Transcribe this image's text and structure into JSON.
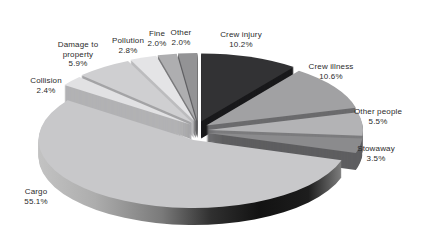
{
  "chart_data": {
    "type": "pie",
    "style": "3d-exploded-pie",
    "title": "",
    "unit": "%",
    "direction": "clockwise",
    "start_angle_deg_from_12": 0,
    "total": 100.0,
    "background": "#ffffff",
    "text_color": "#2b2b2b",
    "geometry": {
      "cx": 198,
      "cy": 131,
      "rx": 155,
      "ry": 68,
      "depth": 17,
      "default_explode": 10
    },
    "slices": [
      {
        "label": "Crew injury",
        "value": 10.2,
        "percent_label": "10.2%",
        "color": "#323234",
        "wall": "#19191b",
        "label_lines": [
          "Crew injury",
          "10.2%"
        ],
        "label_x": 241,
        "label_y": 30
      },
      {
        "label": "Crew illness",
        "value": 10.6,
        "percent_label": "10.6%",
        "color": "#a1a1a3",
        "wall": "#6b6b6d",
        "label_lines": [
          "Crew illness",
          "10.6%"
        ],
        "label_x": 331,
        "label_y": 62
      },
      {
        "label": "Other people",
        "value": 5.5,
        "percent_label": "5.5%",
        "color": "#b3b3b5",
        "wall": "#7c7c7e",
        "label_lines": [
          "Other people",
          "5.5%"
        ],
        "label_x": 378,
        "label_y": 107
      },
      {
        "label": "Stowaway",
        "value": 3.5,
        "percent_label": "3.5%",
        "color": "#8b8b8d",
        "wall": "#5e5e60",
        "label_lines": [
          "Stowaway",
          "3.5%"
        ],
        "label_x": 376,
        "label_y": 144
      },
      {
        "label": "Cargo",
        "value": 55.1,
        "percent_label": "55.1%",
        "color": "#c8c8ca",
        "wall_gradient": {
          "x1": 40,
          "y1": 200,
          "x2": 345,
          "y2": 200,
          "stops": [
            [
              0,
              "#c2c2c2"
            ],
            [
              0.18,
              "#adadad"
            ],
            [
              0.4,
              "#7a7a7a"
            ],
            [
              0.56,
              "#303030"
            ],
            [
              0.72,
              "#121212"
            ],
            [
              0.88,
              "#1d1d1d"
            ],
            [
              1,
              "#888888"
            ]
          ]
        },
        "label_lines": [
          "Cargo",
          "55.1%"
        ],
        "label_x": 36,
        "label_y": 187
      },
      {
        "label": "Collision",
        "value": 2.4,
        "percent_label": "2.4%",
        "color": "#e1e1e3",
        "wall": "#b2b2b4",
        "label_lines": [
          "Collision",
          "2.4%"
        ],
        "label_x": 46,
        "label_y": 76
      },
      {
        "label": "Damage to property",
        "value": 5.9,
        "percent_label": "5.9%",
        "color": "#cfcfd1",
        "wall": "#a4a4a6",
        "label_lines": [
          "Damage to",
          "property",
          "5.9%"
        ],
        "label_x": 78,
        "label_y": 40
      },
      {
        "label": "Pollution",
        "value": 2.8,
        "percent_label": "2.8%",
        "color": "#e4e4e6",
        "wall": "#bcbcbe",
        "label_lines": [
          "Pollution",
          "2.8%"
        ],
        "label_x": 128,
        "label_y": 36
      },
      {
        "label": "Fine",
        "value": 2.0,
        "percent_label": "2.0%",
        "color": "#aeaeb0",
        "wall": "#7a7a7c",
        "label_lines": [
          "Fine",
          "2.0%"
        ],
        "label_x": 157,
        "label_y": 29
      },
      {
        "label": "Other",
        "value": 2.0,
        "percent_label": "2.0%",
        "color": "#939395",
        "wall": "#626264",
        "label_lines": [
          "Other",
          "2.0%"
        ],
        "label_x": 181,
        "label_y": 28
      }
    ]
  }
}
